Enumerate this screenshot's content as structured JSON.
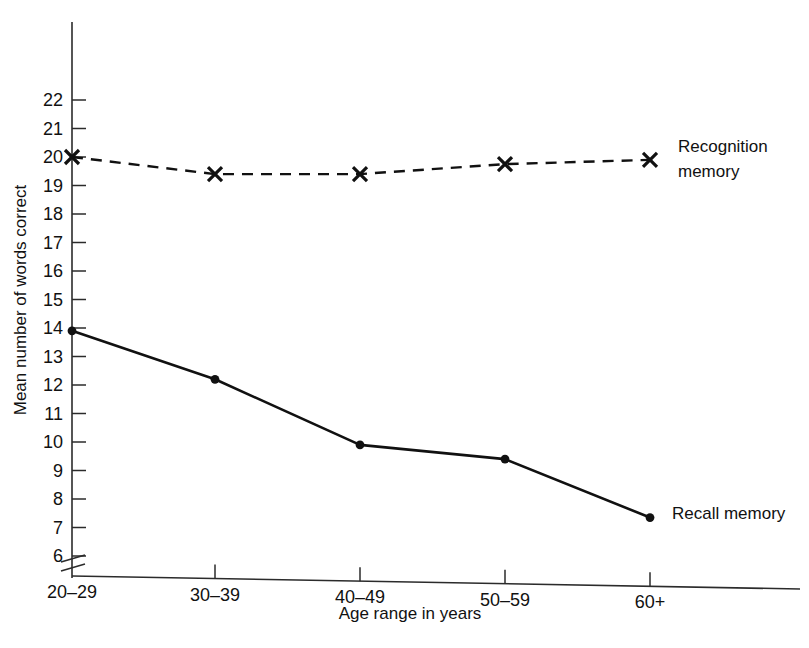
{
  "chart_data": {
    "type": "line",
    "title": "",
    "xlabel": "Age range in years",
    "ylabel": "Mean number of words correct",
    "categories": [
      "20–29",
      "30–39",
      "40–49",
      "50–59",
      "60+"
    ],
    "ylim": [
      6,
      22
    ],
    "yticks": [
      6,
      7,
      8,
      9,
      10,
      11,
      12,
      13,
      14,
      15,
      16,
      17,
      18,
      19,
      20,
      21,
      22
    ],
    "ytick_labels": [
      "6",
      "7",
      "8",
      "9",
      "10",
      "11",
      "12",
      "13",
      "14",
      "15",
      "16",
      "17",
      "18",
      "19",
      "20",
      "21",
      "22"
    ],
    "grid": false,
    "axis_break": true,
    "legend_position": "inline-right",
    "series": [
      {
        "name": "Recognition memory",
        "label_line1": "Recognition",
        "label_line2": "memory",
        "values": [
          20.0,
          19.4,
          19.4,
          19.75,
          19.9
        ],
        "linestyle": "dashed",
        "marker": "cross",
        "color": "#111111"
      },
      {
        "name": "Recall memory",
        "label_line1": "Recall memory",
        "label_line2": "",
        "values": [
          13.9,
          12.2,
          9.9,
          9.4,
          7.35
        ],
        "linestyle": "solid",
        "marker": "dot",
        "color": "#111111"
      }
    ]
  },
  "figure": {
    "background_color": "#ffffff",
    "ink_color": "#111111"
  }
}
